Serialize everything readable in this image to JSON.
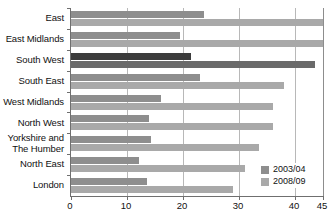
{
  "chart_data": {
    "type": "bar",
    "orientation": "horizontal",
    "title": "",
    "subtitle": "",
    "xlabel": "",
    "ylabel": "",
    "xlim": [
      0,
      45
    ],
    "grid": true,
    "gridlines_x": [
      0,
      10,
      20,
      30,
      40,
      45
    ],
    "xticks": [
      0,
      10,
      20,
      30,
      40,
      45
    ],
    "xtick_labels": [
      "0",
      "10",
      "20",
      "30",
      "40",
      "45"
    ],
    "legend_position": "bottom-right",
    "categories": [
      "East",
      "East Midlands",
      "South West",
      "South East",
      "West Midlands",
      "North West",
      "Yorkshire and\nThe Humber",
      "North East",
      "London"
    ],
    "highlight_category": "South West",
    "series": [
      {
        "name": "2003/04",
        "color": "#8e8e8e",
        "highlight_color": "#3c3c3c",
        "values": [
          23.7,
          19.5,
          21.5,
          23.0,
          16.0,
          14.0,
          14.3,
          12.2,
          13.5
        ]
      },
      {
        "name": "2008/09",
        "color": "#a9a9a9",
        "highlight_color": "#6a6a6a",
        "values": [
          45.0,
          45.0,
          43.5,
          38.0,
          36.0,
          36.0,
          33.5,
          31.0,
          29.0
        ]
      }
    ]
  },
  "legend": {
    "items": [
      {
        "label": "2003/04"
      },
      {
        "label": "2008/09"
      }
    ]
  },
  "colors": {
    "series_2003": "#8e8e8e",
    "series_2008": "#a9a9a9",
    "highlight_2003": "#3c3c3c",
    "highlight_2008": "#6a6a6a",
    "axis": "#6f6f6f",
    "gridline": "#b8b8b8",
    "background": "#ffffff"
  }
}
